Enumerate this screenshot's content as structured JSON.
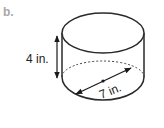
{
  "figure": {
    "part_label": "b.",
    "shape": "cylinder",
    "height_label": "4 in.",
    "diameter_label": "7 in.",
    "colors": {
      "stroke": "#2a2a2a",
      "part_label": "#a8a8a8",
      "background": "#ffffff"
    }
  }
}
